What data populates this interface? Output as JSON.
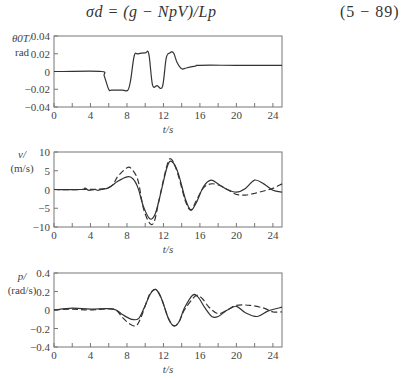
{
  "equation": {
    "text": "σd = (g − NpV)/Lp",
    "number": "(5 − 89)"
  },
  "chart_data": [
    {
      "type": "line",
      "title": "",
      "ylabel": "θ0T/ rad",
      "ylabel_line1": "θ0T/",
      "ylabel_line2": "rad",
      "xlabel": "t/s",
      "xlim": [
        0,
        25
      ],
      "ylim": [
        -0.04,
        0.04
      ],
      "xticks": [
        0,
        4,
        8,
        12,
        16,
        20,
        24
      ],
      "yticks": [
        0.04,
        0.02,
        0,
        -0.02,
        -0.04
      ],
      "ytick_labels": [
        "0.04",
        "0.02",
        "0",
        "−0.02",
        "−0.04"
      ],
      "series": [
        {
          "name": "solid",
          "style": "solid",
          "x": [
            0,
            1,
            5.2,
            5.5,
            6.0,
            6.3,
            7.5,
            8.1,
            8.4,
            8.8,
            9.2,
            10.0,
            10.4,
            10.8,
            11.3,
            11.9,
            12.3,
            12.7,
            13.1,
            13.5,
            14.0,
            14.5,
            15.5,
            16,
            20,
            25
          ],
          "y": [
            0,
            0,
            0,
            -0.005,
            -0.02,
            -0.021,
            -0.021,
            -0.021,
            -0.01,
            0.018,
            0.02,
            0.021,
            0.02,
            -0.015,
            -0.016,
            -0.017,
            0.015,
            0.021,
            0.021,
            0.01,
            0.003,
            0.004,
            0.006,
            0.007,
            0.007,
            0.007
          ]
        }
      ]
    },
    {
      "type": "line",
      "title": "",
      "ylabel": "v/ (m/s)",
      "ylabel_line1": "v/",
      "ylabel_line2": "(m/s)",
      "xlabel": "t/s",
      "xlim": [
        0,
        25
      ],
      "ylim": [
        -10,
        10
      ],
      "xticks": [
        0,
        4,
        8,
        12,
        16,
        20,
        24
      ],
      "yticks": [
        10,
        5,
        0,
        -5,
        -10
      ],
      "ytick_labels": [
        "10",
        "5",
        "0",
        "−5",
        "−10"
      ],
      "series": [
        {
          "name": "solid",
          "style": "solid",
          "x": [
            0,
            3,
            3.4,
            3.8,
            4.5,
            4.8,
            5.2,
            6,
            7,
            8,
            8.6,
            9.2,
            9.8,
            10.5,
            11.1,
            11.7,
            12.4,
            12.9,
            13.6,
            14.4,
            15.0,
            15.6,
            16.4,
            17.2,
            18.0,
            19.0,
            20.0,
            21.0,
            22.0,
            23.0,
            24.0,
            25
          ],
          "y": [
            0,
            0,
            0.4,
            -0.2,
            0,
            -0.2,
            0,
            0.5,
            2.2,
            3.4,
            3.0,
            0.5,
            -4.5,
            -7.8,
            -6.5,
            -1.0,
            6.0,
            7.5,
            4.5,
            -2.5,
            -5.5,
            -3.5,
            0.8,
            2.5,
            1.5,
            0.0,
            -0.7,
            0.3,
            2.5,
            1.5,
            -0.2,
            -0.7
          ]
        },
        {
          "name": "dashed",
          "style": "dashed",
          "x": [
            0,
            3,
            6,
            7,
            8,
            8.5,
            9.2,
            9.8,
            10.5,
            11.0,
            11.5,
            12.4,
            12.9,
            13.6,
            14.4,
            15.0,
            15.6,
            16.4,
            17.2,
            18.0,
            19.0,
            20.0,
            21.0,
            22.0,
            23.0,
            24.0,
            25
          ],
          "y": [
            0,
            0,
            0.5,
            3.5,
            5.8,
            5.5,
            2.5,
            -5.0,
            -9.0,
            -8.5,
            -3.0,
            6.5,
            8.0,
            4.0,
            -3.0,
            -5.5,
            -3.0,
            0.5,
            1.5,
            1.2,
            0.0,
            -1.3,
            -1.5,
            -1.0,
            -0.4,
            0.3,
            1.5
          ]
        }
      ]
    },
    {
      "type": "line",
      "title": "",
      "ylabel": "p/ (rad/s)",
      "ylabel_line1": "p/",
      "ylabel_line2": "(rad/s)",
      "xlabel": "t/s",
      "xlim": [
        0,
        25
      ],
      "ylim": [
        -0.4,
        0.4
      ],
      "xticks": [
        0,
        4,
        8,
        12,
        16,
        20,
        24
      ],
      "yticks": [
        0.4,
        0.2,
        0,
        -0.2,
        -0.4
      ],
      "ytick_labels": [
        "0.4",
        "0.2",
        "0",
        "−0.2",
        "−0.4"
      ],
      "series": [
        {
          "name": "solid",
          "style": "solid",
          "x": [
            0,
            2,
            4,
            6.5,
            7.5,
            8.5,
            9.3,
            10.0,
            10.6,
            11.2,
            11.8,
            12.5,
            13.1,
            13.7,
            14.3,
            15.2,
            15.8,
            16.5,
            17.3,
            18.0,
            19.0,
            20.0,
            21.0,
            22.3,
            23.5,
            25
          ],
          "y": [
            0,
            0.02,
            0.01,
            0.01,
            -0.05,
            -0.1,
            -0.09,
            0.05,
            0.18,
            0.22,
            0.12,
            -0.08,
            -0.17,
            -0.13,
            0.02,
            0.16,
            0.14,
            0.03,
            -0.07,
            -0.07,
            0.0,
            0.04,
            -0.03,
            -0.07,
            -0.01,
            0.03
          ]
        },
        {
          "name": "dashed",
          "style": "dashed",
          "x": [
            0,
            2,
            4,
            6.5,
            7.5,
            8.3,
            9.0,
            9.5,
            10.2,
            10.6,
            11.2,
            11.8,
            12.5,
            13.1,
            13.7,
            14.3,
            15.5,
            16.2,
            17.0,
            18.0,
            19.0,
            20.0,
            21.5,
            23.0,
            24.0,
            25
          ],
          "y": [
            0,
            0.01,
            0.0,
            0.01,
            -0.08,
            -0.15,
            -0.17,
            -0.09,
            0.1,
            0.19,
            0.22,
            0.12,
            -0.08,
            -0.17,
            -0.13,
            0.0,
            0.15,
            0.13,
            0.03,
            -0.04,
            0.0,
            0.05,
            0.05,
            0.02,
            -0.02,
            -0.02
          ]
        }
      ]
    }
  ]
}
